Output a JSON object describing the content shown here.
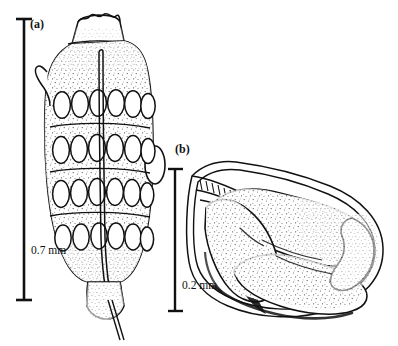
{
  "figure": {
    "kind": "scientific-line-drawing",
    "background_color": "#ffffff",
    "ink_color": "#111111",
    "panels": [
      {
        "id": "a",
        "label": "(a)",
        "subject": "gravid-proglottid-with-egg-rows",
        "scale_bar": {
          "label": "0.7 mm",
          "orientation": "vertical",
          "value": 0.7,
          "unit": "mm"
        }
      },
      {
        "id": "b",
        "label": "(b)",
        "subject": "coiled-larva-in-membrane",
        "scale_bar": {
          "label": "0.2 mm",
          "orientation": "vertical",
          "value": 0.2,
          "unit": "mm"
        }
      }
    ]
  },
  "panel_a": {
    "label": "(a)",
    "scale_label": "0.7 mm",
    "egg_rows": 4,
    "eggs_per_row": 6,
    "features": [
      "crenulate-apical-crown",
      "dense-hatched-band",
      "lateral-hook-notch",
      "lateral-oval-body",
      "median-longitudinal-canal",
      "stippled-parenchyma",
      "tapering-stalk"
    ]
  },
  "panel_b": {
    "label": "(b)",
    "scale_label": "0.2 mm",
    "features": [
      "outer-membrane-envelope",
      "coiled-body-loops",
      "anterior-neck",
      "stippled-interior",
      "dense-ventral-shading"
    ]
  },
  "caption": {
    "cropped_text": ""
  }
}
